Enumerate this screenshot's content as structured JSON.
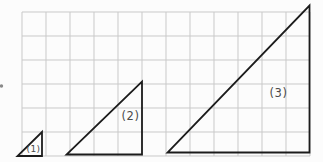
{
  "figure": {
    "description_label": "triangle-similarity-grid-figure",
    "background": "#fcfcfc",
    "grid": {
      "left": 22,
      "top": 12,
      "cell": 24,
      "cols": 12,
      "rows": 6,
      "color": "#c9c9c9",
      "stroke_width": 1
    },
    "stroke_color": "#1c1c1c",
    "stroke_width": 1.8,
    "label_color": "#4a4a4a",
    "edge_mark": {
      "x": 1.5,
      "y": 86,
      "r": 1.7,
      "color": "#8a8a8a"
    },
    "triangles": [
      {
        "label": "(1)",
        "points": [
          [
            17.5,
            156
          ],
          [
            42,
            156
          ],
          [
            42,
            132
          ]
        ],
        "label_x": 33.5,
        "label_y": 151.5,
        "label_size": 9
      },
      {
        "label": "(2)",
        "points": [
          [
            66.5,
            154.5
          ],
          [
            142,
            154.5
          ],
          [
            142,
            81.5
          ]
        ],
        "label_x": 130.5,
        "label_y": 120,
        "label_size": 11.5
      },
      {
        "label": "(3)",
        "points": [
          [
            167.5,
            152.5
          ],
          [
            309.5,
            152.5
          ],
          [
            309.5,
            5.5
          ]
        ],
        "label_x": 278.5,
        "label_y": 97,
        "label_size": 11.5
      }
    ]
  }
}
